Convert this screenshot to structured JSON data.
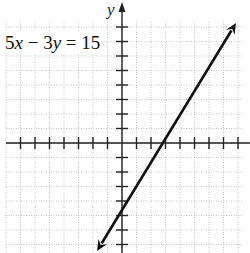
{
  "chart_data": {
    "type": "line",
    "title": "",
    "equation": "5x − 3y = 15",
    "xlabel": "",
    "ylabel": "y",
    "xlim": [
      -8,
      8
    ],
    "ylim": [
      -8,
      8
    ],
    "grid": true,
    "tick_spacing": 1,
    "series": [
      {
        "name": "5x − 3y = 15",
        "x": [
          -0.6,
          0,
          3,
          7.9
        ],
        "y": [
          -6,
          -5,
          0,
          8.2
        ],
        "slope": 1.6667,
        "intercept": -5,
        "arrows": "both"
      }
    ],
    "annotations": [
      {
        "text": "5x − 3y = 15",
        "position": "upper-left"
      }
    ]
  },
  "labels": {
    "equation_prefix_num": "5",
    "equation_x": "x",
    "equation_mid": " − 3",
    "equation_y": "y",
    "equation_suffix": " = 15",
    "y_axis": "y"
  }
}
